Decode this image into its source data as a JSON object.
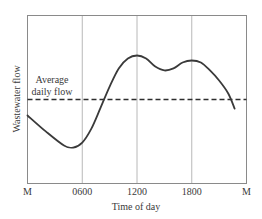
{
  "chart_data": {
    "type": "line",
    "title": "",
    "xlabel": "Time of day",
    "ylabel": "Wastewater flow",
    "x_tick_labels": [
      "M",
      "0600",
      "1200",
      "1800",
      "M"
    ],
    "x_tick_hours": [
      0,
      6,
      12,
      18,
      24
    ],
    "xlim": [
      0,
      24
    ],
    "ylim": [
      0,
      100
    ],
    "y_units": "relative (% of axis height, no numeric scale shown)",
    "grid": {
      "vertical": true,
      "horizontal": false,
      "vertical_at_hours": [
        6,
        12,
        18
      ]
    },
    "legend": null,
    "annotations": [
      {
        "text_lines": [
          "Average",
          "daily flow"
        ],
        "refers_to": "average-daily-flow-line"
      }
    ],
    "series": [
      {
        "name": "Wastewater flow",
        "style": "solid",
        "x": [
          0,
          2,
          4,
          5,
          6,
          7,
          8,
          9,
          10,
          11,
          12,
          13,
          14,
          15,
          16,
          17,
          18,
          19,
          20,
          21,
          22,
          22.7
        ],
        "values": [
          40.5,
          31,
          22.6,
          21.4,
          24.4,
          32.7,
          45,
          57.7,
          68.5,
          74.4,
          76.2,
          74.4,
          69.6,
          67.3,
          68.5,
          72,
          73.2,
          72,
          67.3,
          61.3,
          53.6,
          44.6
        ]
      },
      {
        "name": "Average daily flow",
        "style": "dashed",
        "x": [
          0,
          24
        ],
        "values": [
          50,
          50
        ]
      }
    ]
  },
  "labels": {
    "ylabel": "Wastewater flow",
    "xlabel": "Time of day",
    "annotation_line1": "Average",
    "annotation_line2": "daily flow",
    "ticks": [
      "M",
      "0600",
      "1200",
      "1800",
      "M"
    ]
  }
}
